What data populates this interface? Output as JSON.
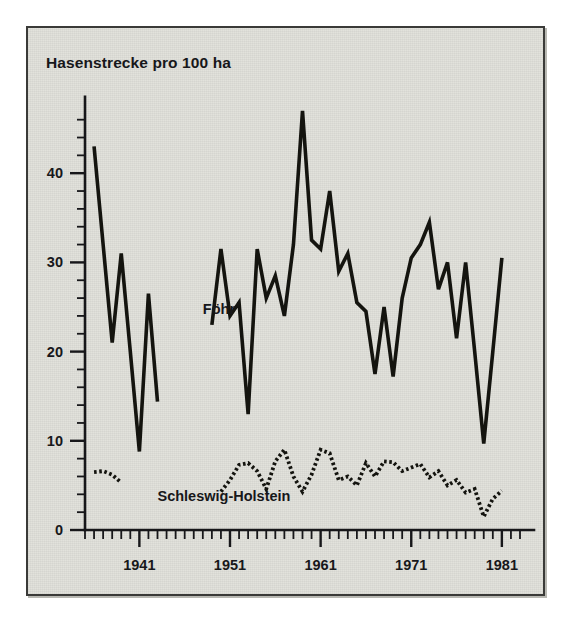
{
  "figure": {
    "background_color": "#e2e2dc",
    "frame_color": "#3a3a38",
    "ink_color": "#14140f"
  },
  "chart_data": {
    "type": "line",
    "title": "Hasenstrecke pro 100 ha",
    "xlabel": "",
    "ylabel": "",
    "xlim": [
      1935,
      1983
    ],
    "ylim": [
      0,
      47
    ],
    "grid": false,
    "legend": "inline-labels",
    "x_ticks_major": [
      1941,
      1951,
      1961,
      1971,
      1981
    ],
    "x_tick_labels": [
      "1941",
      "1951",
      "1961",
      "1971",
      "1981"
    ],
    "x_tick_minor_step": 1,
    "y_ticks_major": [
      0,
      10,
      20,
      30,
      40
    ],
    "y_tick_labels": [
      "0",
      "10",
      "20",
      "30",
      "40"
    ],
    "y_tick_minor_step": 2,
    "series": [
      {
        "name": "Föhr",
        "style": "solid",
        "label_x": 1948,
        "label_y": 24.2,
        "segments": [
          {
            "x": [
              1936,
              1937,
              1938,
              1939,
              1940,
              1941,
              1942,
              1943
            ],
            "values": [
              43.0,
              32.0,
              21.0,
              31.0,
              20.0,
              8.8,
              26.5,
              14.4
            ]
          },
          {
            "x": [
              1949,
              1950,
              1951,
              1952,
              1953,
              1954,
              1955,
              1956,
              1957,
              1958,
              1959,
              1960,
              1961,
              1962,
              1963,
              1964,
              1965,
              1966,
              1967,
              1968,
              1969,
              1970,
              1971,
              1972,
              1973,
              1974,
              1975,
              1976,
              1977,
              1978,
              1979,
              1980,
              1981
            ],
            "values": [
              23.0,
              31.5,
              24.0,
              25.5,
              13.0,
              31.5,
              26.0,
              28.5,
              24.0,
              32.0,
              47.0,
              32.5,
              31.5,
              38.0,
              29.0,
              31.0,
              25.5,
              24.5,
              17.5,
              25.0,
              17.2,
              26.0,
              30.5,
              32.0,
              34.5,
              27.0,
              30.0,
              21.5,
              30.0,
              20.0,
              9.7,
              20.0,
              30.5
            ]
          }
        ]
      },
      {
        "name": "Schleswig-Holstein",
        "style": "dotted",
        "label_x": 1943,
        "label_y": 3.2,
        "segments": [
          {
            "x": [
              1936,
              1937,
              1938,
              1939
            ],
            "values": [
              6.5,
              6.6,
              6.2,
              5.3
            ]
          },
          {
            "x": [
              1950,
              1951,
              1952,
              1953,
              1954,
              1955,
              1956,
              1957,
              1958,
              1959,
              1960,
              1961,
              1962,
              1963,
              1964,
              1965,
              1966,
              1967,
              1968,
              1969,
              1970,
              1971,
              1972,
              1973,
              1974,
              1975,
              1976,
              1977,
              1978,
              1979,
              1980,
              1981
            ],
            "values": [
              4.3,
              5.6,
              7.3,
              7.5,
              6.6,
              4.6,
              7.7,
              9.0,
              6.0,
              4.3,
              6.2,
              9.0,
              8.6,
              5.6,
              6.0,
              5.0,
              7.5,
              6.0,
              7.7,
              7.6,
              6.6,
              7.0,
              7.4,
              5.9,
              6.6,
              5.0,
              5.6,
              4.2,
              4.6,
              1.5,
              3.5,
              4.4
            ]
          }
        ]
      }
    ]
  }
}
